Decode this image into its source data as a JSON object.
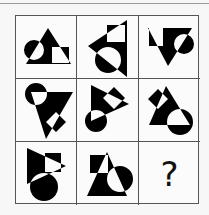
{
  "puzzle": {
    "rows": 3,
    "cols": 3,
    "fill_color": "#000000",
    "background_color": "#fbfbfb",
    "grid_line_color": "#555555",
    "cells": [
      {
        "row": 0,
        "col": 0,
        "shapes": [
          "triangle-up",
          "circle-left",
          "square-right"
        ]
      },
      {
        "row": 0,
        "col": 1,
        "shapes": [
          "triangle-left",
          "square-top",
          "circle-bottom"
        ]
      },
      {
        "row": 0,
        "col": 2,
        "shapes": [
          "triangle-down",
          "square-left",
          "circle-right"
        ]
      },
      {
        "row": 1,
        "col": 0,
        "shapes": [
          "triangle-down",
          "circle-top-left",
          "diamond-square-bottom-right"
        ]
      },
      {
        "row": 1,
        "col": 1,
        "shapes": [
          "triangle-right",
          "diamond-square-right",
          "circle-bottom-left"
        ]
      },
      {
        "row": 1,
        "col": 2,
        "shapes": [
          "triangle-up",
          "diamond-square-left",
          "circle-bottom-right"
        ]
      },
      {
        "row": 2,
        "col": 0,
        "shapes": [
          "triangle-right",
          "square-right",
          "circle-bottom"
        ]
      },
      {
        "row": 2,
        "col": 1,
        "shapes": [
          "triangle-up",
          "square-top-left",
          "circle-right"
        ]
      },
      {
        "row": 2,
        "col": 2,
        "answer_placeholder": "?"
      }
    ]
  }
}
